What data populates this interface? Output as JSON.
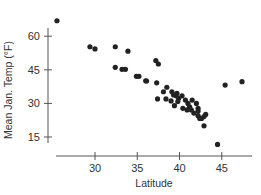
{
  "chart_data": {
    "type": "scatter",
    "title": "",
    "xlabel": "Latitude",
    "ylabel": "Mean Jan. Temp (°F)",
    "xlim": [
      23,
      49
    ],
    "ylim": [
      6,
      70
    ],
    "x_ticks": [
      30,
      35,
      40,
      45
    ],
    "y_ticks": [
      15,
      30,
      45,
      60
    ],
    "grid": false,
    "legend": null,
    "marker_color": "#222222",
    "points": [
      {
        "x": 25.5,
        "y": 66.9
      },
      {
        "x": 29.4,
        "y": 55.3
      },
      {
        "x": 30.0,
        "y": 54.3
      },
      {
        "x": 32.4,
        "y": 55.3
      },
      {
        "x": 33.9,
        "y": 53.3
      },
      {
        "x": 32.4,
        "y": 46.1
      },
      {
        "x": 33.2,
        "y": 45.2
      },
      {
        "x": 33.6,
        "y": 45.2
      },
      {
        "x": 34.9,
        "y": 42.1
      },
      {
        "x": 35.2,
        "y": 42.1
      },
      {
        "x": 36.0,
        "y": 40.1
      },
      {
        "x": 36.1,
        "y": 40.0
      },
      {
        "x": 37.2,
        "y": 49.1
      },
      {
        "x": 37.5,
        "y": 47.6
      },
      {
        "x": 37.3,
        "y": 39.2
      },
      {
        "x": 38.5,
        "y": 37.2
      },
      {
        "x": 38.1,
        "y": 35.2
      },
      {
        "x": 37.4,
        "y": 32.0
      },
      {
        "x": 38.4,
        "y": 32.0
      },
      {
        "x": 39.0,
        "y": 31.1
      },
      {
        "x": 39.1,
        "y": 35.2
      },
      {
        "x": 39.3,
        "y": 33.8
      },
      {
        "x": 39.7,
        "y": 34.5
      },
      {
        "x": 39.6,
        "y": 33.4
      },
      {
        "x": 39.9,
        "y": 32.3
      },
      {
        "x": 40.3,
        "y": 33.4
      },
      {
        "x": 39.4,
        "y": 29.0
      },
      {
        "x": 39.8,
        "y": 30.8
      },
      {
        "x": 40.4,
        "y": 27.8
      },
      {
        "x": 40.7,
        "y": 31.5
      },
      {
        "x": 41.0,
        "y": 30.0
      },
      {
        "x": 41.2,
        "y": 28.5
      },
      {
        "x": 41.4,
        "y": 27.1
      },
      {
        "x": 40.9,
        "y": 27.1
      },
      {
        "x": 41.5,
        "y": 31.5
      },
      {
        "x": 41.7,
        "y": 25.7
      },
      {
        "x": 42.0,
        "y": 30.0
      },
      {
        "x": 42.2,
        "y": 27.8
      },
      {
        "x": 42.2,
        "y": 26.6
      },
      {
        "x": 42.2,
        "y": 24.5
      },
      {
        "x": 42.4,
        "y": 23.3
      },
      {
        "x": 42.6,
        "y": 23.3
      },
      {
        "x": 42.9,
        "y": 24.1
      },
      {
        "x": 43.1,
        "y": 25.1
      },
      {
        "x": 42.9,
        "y": 20.0
      },
      {
        "x": 44.5,
        "y": 11.7
      },
      {
        "x": 45.4,
        "y": 38.2
      },
      {
        "x": 47.4,
        "y": 39.7
      }
    ]
  },
  "layout": {
    "y_axis_x": 48,
    "y_axis_top": 28,
    "y_axis_bottom": 143,
    "x_axis_y": 156,
    "x_axis_left": 56,
    "x_axis_right": 252,
    "x_px_per_unit": 8.45,
    "x_origin_value": 30,
    "x_origin_px": 95,
    "y_px_per_unit": 2.24,
    "y_origin_value": 15,
    "y_origin_px": 137,
    "tick_len": 4,
    "marker_radius": 2.6
  }
}
